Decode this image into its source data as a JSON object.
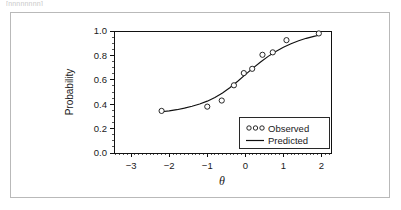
{
  "page": {
    "clipped_header_text": "[nnnnnnnn]"
  },
  "chart_data": {
    "type": "scatter",
    "title": "",
    "subtitle": "",
    "xlabel": "θ",
    "ylabel": "Probability",
    "xlim": [
      -3.45,
      2.25
    ],
    "ylim": [
      0.0,
      1.0
    ],
    "grid": false,
    "legend_position": "bottom-right",
    "x_ticks": [
      -3,
      -2,
      -1,
      0,
      1,
      2
    ],
    "x_tick_labels": [
      "−3",
      "−2",
      "−1",
      "0",
      "1",
      "2"
    ],
    "y_ticks": [
      0.0,
      0.2,
      0.4,
      0.6,
      0.8,
      1.0
    ],
    "y_tick_labels": [
      "0.0",
      "0.2",
      "0.4",
      "0.6",
      "0.8",
      "1.0"
    ],
    "x_minor_tick_step": 0.1,
    "y_minor_tick_step": 0.05,
    "series": [
      {
        "name": "Observed",
        "type": "scatter",
        "marker": "open-circle",
        "x": [
          -2.2,
          -1.0,
          -0.62,
          -0.3,
          -0.04,
          0.18,
          0.45,
          0.72,
          1.08,
          1.93
        ],
        "y": [
          0.345,
          0.38,
          0.43,
          0.555,
          0.655,
          0.69,
          0.805,
          0.825,
          0.925,
          0.98
        ]
      },
      {
        "name": "Predicted",
        "type": "line",
        "x": [
          -2.2,
          -2.0,
          -1.8,
          -1.6,
          -1.4,
          -1.2,
          -1.0,
          -0.8,
          -0.6,
          -0.4,
          -0.2,
          0.0,
          0.2,
          0.4,
          0.6,
          0.8,
          1.0,
          1.2,
          1.4,
          1.6,
          1.8,
          1.93
        ],
        "y": [
          0.338,
          0.345,
          0.355,
          0.368,
          0.383,
          0.402,
          0.425,
          0.455,
          0.492,
          0.537,
          0.588,
          0.642,
          0.696,
          0.746,
          0.792,
          0.832,
          0.866,
          0.896,
          0.92,
          0.94,
          0.956,
          0.965
        ]
      }
    ],
    "legend_entries": [
      {
        "label": "Observed",
        "marker": "ooo"
      },
      {
        "label": "Predicted",
        "marker": "line"
      }
    ],
    "colors": {
      "curve": "#111111",
      "marker_stroke": "#111111",
      "marker_fill": "#ffffff",
      "axis": "#111111",
      "frame": "#b9b9b9",
      "background": "#ffffff"
    }
  }
}
